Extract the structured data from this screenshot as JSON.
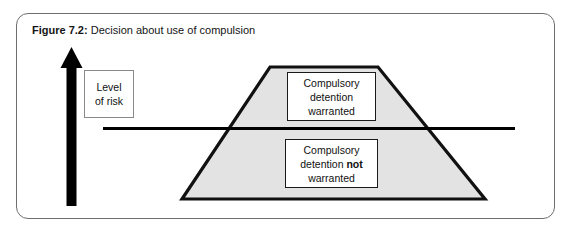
{
  "figure": {
    "caption_label": "Figure 7.2:",
    "caption_text": " Decision about use of compulsion",
    "panel_border_color": "#6e6e6e"
  },
  "axis": {
    "arrow_name": "level-of-risk-arrow",
    "arrow_color": "#000000",
    "label_box": {
      "line1": "Level",
      "line2": "of risk"
    }
  },
  "threshold_line": {
    "color": "#000000",
    "x_start": 103,
    "x_end": 515,
    "y": 128
  },
  "trapezoid": {
    "fill": "#e3e3e3",
    "stroke": "#111111",
    "points": "270,67 378,67 485,199 182,199"
  },
  "upper_box": {
    "line1": "Compulsory",
    "line2": "detention",
    "line3": "warranted"
  },
  "lower_box": {
    "line1": "Compulsory",
    "line2_prefix": "detention ",
    "line2_emphasis": "not",
    "line3": "warranted"
  },
  "chart_data": {
    "type": "diagram",
    "title": "Figure 7.2: Decision about use of compulsion",
    "ylabel": "Level of risk",
    "regions": [
      {
        "name": "above-threshold",
        "label": "Compulsory detention warranted",
        "position": "upper"
      },
      {
        "name": "below-threshold",
        "label": "Compulsory detention not warranted",
        "position": "lower"
      }
    ],
    "threshold": {
      "label": "",
      "description": "horizontal line dividing the risk population"
    },
    "shape": {
      "kind": "trapezoid",
      "fill": "#e3e3e3",
      "meaning": "population distributed by level of risk"
    }
  }
}
